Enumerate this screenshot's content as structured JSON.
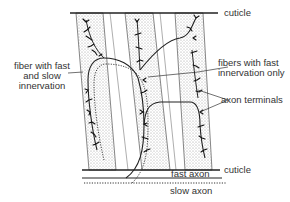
{
  "diagram": {
    "labels": {
      "cuticle_top": "cuticle",
      "cuticle_bottom": "cuticle",
      "fiber_fast_slow_line1": "fiber with fast",
      "fiber_fast_slow_line2": "and slow",
      "fiber_fast_slow_line3": "innervation",
      "fibers_fast_only_line1": "fibers with fast",
      "fibers_fast_only_line2": "innervation only",
      "axon_terminals": "axon terminals",
      "fast_axon": "fast axon",
      "slow_axon": "slow axon"
    },
    "colors": {
      "line": "#222222",
      "stipple": "#cfcfcf",
      "text": "#333333"
    }
  }
}
